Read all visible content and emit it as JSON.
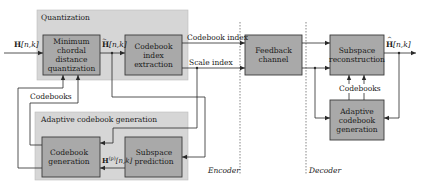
{
  "diagram": {
    "groups": {
      "quantization": {
        "title": "Quantization"
      },
      "adaptive_codebook_generation": {
        "title": "Adaptive codebook generation"
      }
    },
    "blocks": {
      "min_chordal": {
        "label": "Minimum chordal distance quantization"
      },
      "codebook_index_extraction": {
        "label": "Codebook index extraction"
      },
      "codebook_generation": {
        "label": "Codebook generation"
      },
      "subspace_prediction": {
        "label": "Subspace prediction"
      },
      "feedback_channel": {
        "label": "Feedback channel"
      },
      "subspace_reconstruction": {
        "label": "Subspace reconstruction"
      },
      "decoder_adaptive_codebook_generation": {
        "label": "Adaptive codebook generation"
      }
    },
    "signals": {
      "input": {
        "symbol": "H",
        "args": "[n,k]"
      },
      "quantized": {
        "symbol": "H",
        "args": "[n,k]",
        "accent": "~"
      },
      "predicted": {
        "symbol": "H",
        "superscript": "(p)",
        "args": "[n,k]"
      },
      "output": {
        "symbol": "H",
        "args": "[n,k]",
        "accent": "^"
      },
      "codebook_index": "Codebook index",
      "scale_index": "Scale index",
      "codebooks_encoder": "Codebooks",
      "codebooks_decoder": "Codebooks"
    },
    "sections": {
      "encoder": "Encoder",
      "decoder": "Decoder"
    },
    "colors": {
      "group_fill": "#d6d6d6",
      "block_fill": "#a9a9a9",
      "block_border": "#3a3a3a",
      "line": "#2a2a2a"
    }
  }
}
